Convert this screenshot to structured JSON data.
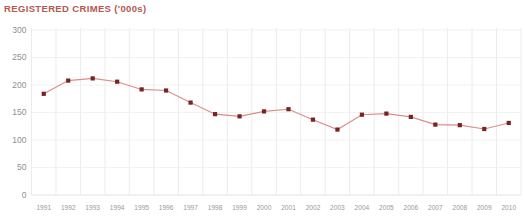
{
  "chart_title": "REGISTERED CRIMES ('000s)",
  "colors": {
    "title": "#b5584f",
    "line": "#d98d8a",
    "marker": "#7b2222",
    "grid": "#ececec",
    "tick_text": "#9a9a9a",
    "background": "#ffffff"
  },
  "chart_data": {
    "type": "line",
    "title": "REGISTERED CRIMES ('000s)",
    "xlabel": "",
    "ylabel": "",
    "ylim": [
      0,
      300
    ],
    "yticks": [
      0,
      50,
      100,
      150,
      200,
      250,
      300
    ],
    "ytick_labels": [
      "0",
      "50",
      "100",
      "150",
      "200",
      "250",
      "300"
    ],
    "grid": "both",
    "legend": "none",
    "markers": "square",
    "categories": [
      "1991",
      "1992",
      "1993",
      "1994",
      "1995",
      "1996",
      "1997",
      "1998",
      "1999",
      "2000",
      "2001",
      "2002",
      "2003",
      "2004",
      "2005",
      "2006",
      "2007",
      "2008",
      "2009",
      "2010"
    ],
    "values": [
      184,
      208,
      212,
      206,
      192,
      190,
      168,
      147,
      143,
      152,
      156,
      137,
      119,
      146,
      148,
      142,
      128,
      127,
      120,
      131
    ],
    "series": [
      {
        "name": "Registered crimes ('000s)",
        "values": [
          184,
          208,
          212,
          206,
          192,
          190,
          168,
          147,
          143,
          152,
          156,
          137,
          119,
          146,
          148,
          142,
          128,
          127,
          120,
          131
        ]
      }
    ]
  }
}
